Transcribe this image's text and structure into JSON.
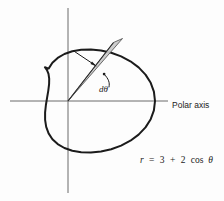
{
  "figure": {
    "background_color": "#fdfdfd",
    "curve_color": "#1b1b1b",
    "axis_color": "#6b6b6b",
    "wedge_fill_color": "#c9c9c9",
    "wedge_edge_color": "#4a4a4a"
  },
  "labels": {
    "polar_axis": "Polar axis",
    "differential_angle": "dθ",
    "equation": "r = 3 + 2 cos θ",
    "equation_parts": {
      "r": "r",
      "equals": "=",
      "constant": "3",
      "plus": "+",
      "coefficient": "2",
      "function": "cos",
      "theta": "θ"
    }
  },
  "geometry": {
    "pole_x": 68,
    "pole_y": 101,
    "units_per_pixel": 17.4,
    "r_max": 5,
    "r_min": 1,
    "curve_equation_a": 3,
    "curve_equation_b": 2,
    "wedge_angle_start_deg": 50,
    "wedge_angle_end_deg": 57,
    "horizontal_axis_x1": 10,
    "horizontal_axis_x2": 168,
    "vertical_axis_y1": 8,
    "vertical_axis_y2": 193
  }
}
